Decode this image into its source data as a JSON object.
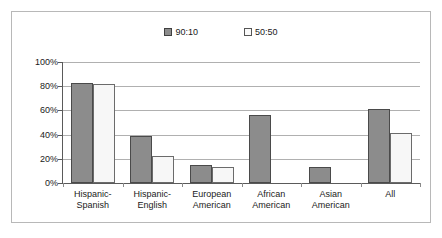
{
  "chart_data": {
    "type": "bar",
    "title": "",
    "xlabel": "",
    "ylabel": "",
    "ylim": [
      0,
      100
    ],
    "ytick_labels": [
      "100%",
      "80%",
      "60%",
      "40%",
      "20%",
      "0%"
    ],
    "ytick_values": [
      100,
      80,
      60,
      40,
      20,
      0
    ],
    "grid": true,
    "legend_position": "top-center",
    "categories": [
      "Hispanic-Spanish",
      "Hispanic-English",
      "European American",
      "African American",
      "Asian American",
      "All"
    ],
    "category_lines": [
      [
        "Hispanic-",
        "Spanish"
      ],
      [
        "Hispanic-",
        "English"
      ],
      [
        "European",
        "American"
      ],
      [
        "African",
        "American"
      ],
      [
        "Asian",
        "American"
      ],
      [
        "All",
        ""
      ]
    ],
    "series": [
      {
        "name": "90:10",
        "color": "#8c8c8c",
        "values": [
          83,
          39,
          15,
          56,
          13,
          61
        ]
      },
      {
        "name": "50:50",
        "color": "#f7f7f7",
        "values": [
          82,
          22,
          13,
          0,
          0,
          41
        ]
      }
    ]
  },
  "legend": {
    "entries": [
      {
        "label": "90:10",
        "swatch": "filled-gray-square-icon"
      },
      {
        "label": "50:50",
        "swatch": "open-white-square-icon"
      }
    ]
  }
}
